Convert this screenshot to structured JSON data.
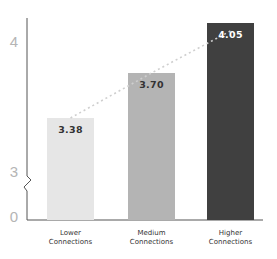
{
  "chart_data": {
    "type": "bar",
    "title": "",
    "xlabel": "",
    "ylabel": "",
    "categories": [
      "Lower Connections",
      "Medium Connections",
      "Higher Connections"
    ],
    "category_lines": [
      [
        "Lower",
        "Connections"
      ],
      [
        "Medium",
        "Connections"
      ],
      [
        "Higher",
        "Connections"
      ]
    ],
    "values": [
      3.38,
      3.7,
      4.05
    ],
    "value_labels": [
      "3.38",
      "3.70",
      "4.05"
    ],
    "bar_colors": [
      "#e6e6e6",
      "#b4b4b4",
      "#404040"
    ],
    "value_label_colors": [
      "#333333",
      "#333333",
      "#ffffff"
    ],
    "y_ticks": [
      {
        "label": "4",
        "value": 4
      },
      {
        "label": "3",
        "value": 3
      },
      {
        "label": "0",
        "value": 0
      }
    ],
    "ylim": [
      0,
      4.1
    ],
    "axis_break": true,
    "axis_break_between": [
      0,
      3
    ],
    "trend_line": {
      "style": "dotted",
      "color": "#cccccc",
      "connects": "bar_tops"
    },
    "grid": false,
    "legend": null
  }
}
